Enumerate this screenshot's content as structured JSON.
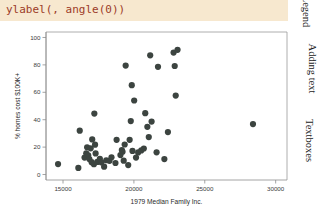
{
  "code_banner": {
    "text": "ylabel(, angle(0))",
    "color": "#9c3b28",
    "background": "#f7e8cf"
  },
  "side_tabs": [
    {
      "label": "Legend"
    },
    {
      "label": "Adding text"
    },
    {
      "label": "Textboxes"
    }
  ],
  "chart_data": {
    "type": "scatter",
    "title": "",
    "xlabel": "1979 Median Family Inc.",
    "ylabel": "% homes cost $100K+",
    "ylabel_angle": 0,
    "xlim": [
      13800,
      30800
    ],
    "ylim": [
      -4,
      104
    ],
    "xticks": [
      15000,
      20000,
      25000,
      30000
    ],
    "yticks": [
      0,
      20,
      40,
      60,
      80,
      100
    ],
    "xtick_labels": [
      "15000",
      "20000",
      "25000",
      "30000"
    ],
    "ytick_labels": [
      "0",
      "20",
      "40",
      "60",
      "80",
      "100"
    ],
    "grid": false,
    "legend": null,
    "marker_color": "#3c4440",
    "marker_size": 3.1,
    "points": [
      {
        "x": 14650,
        "y": 7.6
      },
      {
        "x": 16080,
        "y": 4.8
      },
      {
        "x": 16180,
        "y": 32.0
      },
      {
        "x": 16520,
        "y": 12.4
      },
      {
        "x": 16640,
        "y": 15.5
      },
      {
        "x": 16700,
        "y": 19.9
      },
      {
        "x": 16780,
        "y": 14.0
      },
      {
        "x": 16860,
        "y": 11.3
      },
      {
        "x": 16950,
        "y": 19.1
      },
      {
        "x": 17020,
        "y": 9.0
      },
      {
        "x": 17060,
        "y": 25.6
      },
      {
        "x": 17180,
        "y": 7.5
      },
      {
        "x": 17210,
        "y": 44.5
      },
      {
        "x": 17260,
        "y": 21.8
      },
      {
        "x": 17300,
        "y": 15.4
      },
      {
        "x": 17420,
        "y": 9.2
      },
      {
        "x": 17600,
        "y": 11.5
      },
      {
        "x": 17700,
        "y": 8.9
      },
      {
        "x": 17900,
        "y": 5.7
      },
      {
        "x": 18050,
        "y": 10.4
      },
      {
        "x": 18280,
        "y": 10.0
      },
      {
        "x": 18420,
        "y": 12.6
      },
      {
        "x": 18700,
        "y": 8.4
      },
      {
        "x": 18780,
        "y": 25.3
      },
      {
        "x": 19050,
        "y": 14.2
      },
      {
        "x": 19150,
        "y": 17.9
      },
      {
        "x": 19200,
        "y": 16.6
      },
      {
        "x": 19280,
        "y": 10.1
      },
      {
        "x": 19350,
        "y": 21.9
      },
      {
        "x": 19420,
        "y": 79.5
      },
      {
        "x": 19600,
        "y": 6.9
      },
      {
        "x": 19700,
        "y": 25.3
      },
      {
        "x": 19780,
        "y": 39.0
      },
      {
        "x": 19850,
        "y": 65.2
      },
      {
        "x": 19900,
        "y": 17.2
      },
      {
        "x": 20020,
        "y": 54.0
      },
      {
        "x": 20150,
        "y": 12.4
      },
      {
        "x": 20300,
        "y": 16.1
      },
      {
        "x": 20520,
        "y": 17.6
      },
      {
        "x": 20700,
        "y": 19.0
      },
      {
        "x": 20800,
        "y": 44.8
      },
      {
        "x": 20950,
        "y": 34.8
      },
      {
        "x": 21050,
        "y": 27.3
      },
      {
        "x": 21150,
        "y": 87.0
      },
      {
        "x": 21250,
        "y": 38.6
      },
      {
        "x": 21600,
        "y": 16.2
      },
      {
        "x": 21700,
        "y": 78.6
      },
      {
        "x": 22150,
        "y": 11.3
      },
      {
        "x": 22400,
        "y": 31.0
      },
      {
        "x": 22800,
        "y": 89.0
      },
      {
        "x": 22880,
        "y": 79.2
      },
      {
        "x": 22950,
        "y": 57.6
      },
      {
        "x": 23080,
        "y": 91.0
      },
      {
        "x": 28400,
        "y": 36.8
      }
    ]
  }
}
